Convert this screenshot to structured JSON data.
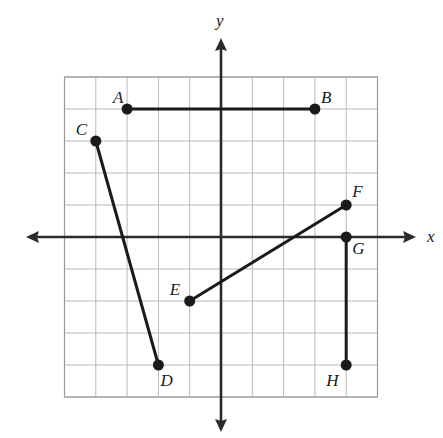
{
  "figure": {
    "type": "coordinate-plane-diagram",
    "width": 443,
    "height": 438,
    "background_color": "#ffffff",
    "grid": {
      "visible": true,
      "line_color": "#b8b8b8",
      "border_color": "#9a9a9a",
      "x_min": -5,
      "x_max": 5,
      "y_min": -5,
      "y_max": 5,
      "cell_size_px_x": 31.3,
      "cell_size_px_y": 32.0,
      "origin_px": [
        221,
        237
      ]
    },
    "axes": {
      "color": "#2b2b2b",
      "x_axis_label": "x",
      "y_axis_label": "y",
      "x_arrow_left_px": 26,
      "x_arrow_right_px": 416,
      "y_arrow_top_px": 38,
      "y_arrow_bottom_px": 432,
      "arrowheads": "both-ends"
    }
  },
  "chart_data": {
    "type": "scatter",
    "title": "",
    "xlabel": "x",
    "ylabel": "y",
    "xlim": [
      -5,
      5
    ],
    "ylim": [
      -5,
      5
    ],
    "grid": true,
    "legend": "none",
    "points": [
      {
        "label": "A",
        "x": -3,
        "y": 4,
        "label_offset": [
          -14,
          -20
        ]
      },
      {
        "label": "B",
        "x": 3,
        "y": 4,
        "label_offset": [
          6,
          -20
        ]
      },
      {
        "label": "C",
        "x": -4,
        "y": 3,
        "label_offset": [
          -20,
          -20
        ]
      },
      {
        "label": "D",
        "x": -2,
        "y": -4,
        "label_offset": [
          2,
          7
        ]
      },
      {
        "label": "E",
        "x": -1,
        "y": -2,
        "label_offset": [
          -20,
          -20
        ]
      },
      {
        "label": "F",
        "x": 4,
        "y": 1,
        "label_offset": [
          6,
          -22
        ]
      },
      {
        "label": "G",
        "x": 4,
        "y": 0,
        "label_offset": [
          6,
          3
        ]
      },
      {
        "label": "H",
        "x": 4,
        "y": -4,
        "label_offset": [
          -20,
          7
        ]
      }
    ],
    "segments": [
      {
        "name": "AB",
        "from": "A",
        "to": "B"
      },
      {
        "name": "CD",
        "from": "C",
        "to": "D"
      },
      {
        "name": "EF",
        "from": "E",
        "to": "F"
      },
      {
        "name": "GH",
        "from": "G",
        "to": "H"
      }
    ],
    "point_style": {
      "marker": "filled-circle",
      "radius_px": 5.5,
      "color": "#1a1a1a"
    },
    "segment_style": {
      "color": "#1a1a1a",
      "width_px": 3
    }
  }
}
